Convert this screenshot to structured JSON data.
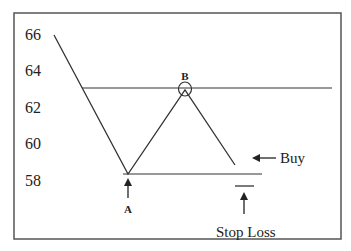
{
  "diagram": {
    "y_axis_ticks": [
      {
        "label": "66",
        "y": 35
      },
      {
        "label": "64",
        "y": 70
      },
      {
        "label": "62",
        "y": 107
      },
      {
        "label": "60",
        "y": 143
      },
      {
        "label": "58",
        "y": 180
      }
    ],
    "points": {
      "A": {
        "label": "A"
      },
      "B": {
        "label": "B"
      }
    },
    "annotations": {
      "buy": "Buy",
      "stop_loss": "Stop Loss"
    },
    "colors": {
      "line": "#333333",
      "frame": "#555555",
      "text": "#222222"
    }
  }
}
